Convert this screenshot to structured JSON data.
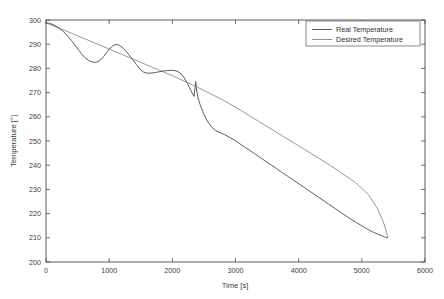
{
  "chart_data": {
    "type": "line",
    "title": "",
    "xlabel": "Time [s]",
    "ylabel": "Temperature [°]",
    "xlim": [
      0,
      6000
    ],
    "ylim": [
      200,
      300
    ],
    "xticks": [
      0,
      1000,
      2000,
      3000,
      4000,
      5000,
      6000
    ],
    "yticks": [
      200,
      210,
      220,
      230,
      240,
      250,
      260,
      270,
      280,
      290,
      300
    ],
    "xtick_labels": [
      "0",
      "1000",
      "2000",
      "3000",
      "4000",
      "5000",
      "6000"
    ],
    "ytick_labels": [
      "200",
      "210",
      "220",
      "230",
      "240",
      "250",
      "260",
      "270",
      "280",
      "290",
      "300"
    ],
    "grid": false,
    "legend_position": "top-right",
    "series": [
      {
        "name": "Real Temperature",
        "color": "#5c5c5c",
        "points": [
          [
            0,
            298.8
          ],
          [
            60,
            298.6
          ],
          [
            120,
            298.0
          ],
          [
            190,
            297.0
          ],
          [
            260,
            295.6
          ],
          [
            330,
            293.8
          ],
          [
            400,
            291.6
          ],
          [
            470,
            289.2
          ],
          [
            540,
            286.8
          ],
          [
            610,
            284.6
          ],
          [
            680,
            283.2
          ],
          [
            730,
            282.6
          ],
          [
            790,
            282.5
          ],
          [
            850,
            283.2
          ],
          [
            910,
            284.8
          ],
          [
            960,
            286.6
          ],
          [
            1010,
            288.2
          ],
          [
            1060,
            289.4
          ],
          [
            1110,
            289.9
          ],
          [
            1160,
            289.6
          ],
          [
            1220,
            288.4
          ],
          [
            1290,
            286.4
          ],
          [
            1360,
            284.0
          ],
          [
            1430,
            281.6
          ],
          [
            1490,
            279.6
          ],
          [
            1550,
            278.4
          ],
          [
            1610,
            278.0
          ],
          [
            1680,
            278.1
          ],
          [
            1750,
            278.4
          ],
          [
            1830,
            278.8
          ],
          [
            1910,
            279.1
          ],
          [
            1990,
            279.2
          ],
          [
            2060,
            279.0
          ],
          [
            2120,
            278.2
          ],
          [
            2180,
            276.4
          ],
          [
            2240,
            273.8
          ],
          [
            2290,
            271.0
          ],
          [
            2330,
            269.0
          ],
          [
            2345,
            268.4
          ],
          [
            2360,
            272.0
          ],
          [
            2370,
            274.6
          ],
          [
            2380,
            272.0
          ],
          [
            2400,
            268.4
          ],
          [
            2440,
            265.0
          ],
          [
            2490,
            261.6
          ],
          [
            2550,
            258.4
          ],
          [
            2620,
            255.8
          ],
          [
            2690,
            254.2
          ],
          [
            2760,
            253.4
          ],
          [
            2830,
            252.6
          ],
          [
            2900,
            251.6
          ],
          [
            2980,
            250.4
          ],
          [
            3060,
            249.0
          ],
          [
            3140,
            247.6
          ],
          [
            3220,
            246.2
          ],
          [
            3300,
            244.8
          ],
          [
            3390,
            243.2
          ],
          [
            3480,
            241.6
          ],
          [
            3570,
            240.0
          ],
          [
            3660,
            238.4
          ],
          [
            3750,
            236.8
          ],
          [
            3840,
            235.2
          ],
          [
            3930,
            233.6
          ],
          [
            4020,
            232.0
          ],
          [
            4110,
            230.4
          ],
          [
            4200,
            228.8
          ],
          [
            4290,
            227.2
          ],
          [
            4380,
            225.6
          ],
          [
            4470,
            224.0
          ],
          [
            4560,
            222.4
          ],
          [
            4650,
            220.8
          ],
          [
            4740,
            219.2
          ],
          [
            4830,
            217.6
          ],
          [
            4920,
            216.2
          ],
          [
            5010,
            214.8
          ],
          [
            5100,
            213.4
          ],
          [
            5190,
            212.2
          ],
          [
            5280,
            211.2
          ],
          [
            5360,
            210.4
          ],
          [
            5410,
            210.0
          ]
        ]
      },
      {
        "name": "Desired Temperature",
        "color": "#8c8c8c",
        "points": [
          [
            0,
            298.8
          ],
          [
            400,
            294.6
          ],
          [
            800,
            290.2
          ],
          [
            1200,
            285.8
          ],
          [
            1600,
            281.4
          ],
          [
            2000,
            277.0
          ],
          [
            2400,
            272.2
          ],
          [
            2800,
            267.0
          ],
          [
            3100,
            262.4
          ],
          [
            3400,
            257.6
          ],
          [
            3700,
            252.8
          ],
          [
            4000,
            248.0
          ],
          [
            4300,
            243.2
          ],
          [
            4600,
            238.2
          ],
          [
            4900,
            232.8
          ],
          [
            5100,
            228.0
          ],
          [
            5250,
            222.0
          ],
          [
            5350,
            215.8
          ],
          [
            5410,
            210.6
          ]
        ]
      }
    ]
  },
  "legend": {
    "entries": [
      {
        "label": "Real Temperature",
        "color": "#5c5c5c"
      },
      {
        "label": "Desired Temperature",
        "color": "#8c8c8c"
      }
    ]
  }
}
